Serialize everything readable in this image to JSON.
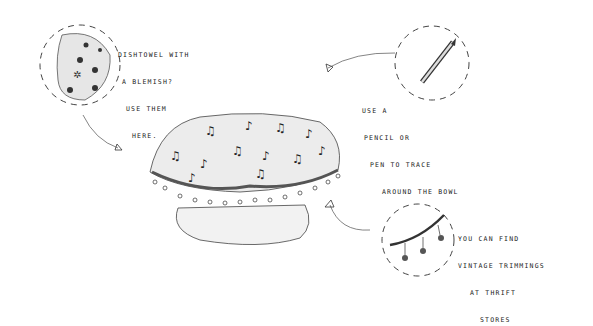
{
  "illustration": {
    "subject": "fabric-covered bowl with music-note print and pom-pom trim",
    "colors": {
      "ink": "#222222",
      "fabric_shade": "#cfcfcf",
      "background": "#ffffff"
    }
  },
  "callouts": [
    {
      "id": "dishtowel",
      "lines": [
        "DISHTOWEL WITH",
        "A BLEMISH?",
        "USE THEM",
        "HERE."
      ]
    },
    {
      "id": "pencil",
      "lines": [
        "USE A",
        "PENCIL OR",
        "PEN TO TRACE",
        "AROUND THE BOWL"
      ]
    },
    {
      "id": "trimmings",
      "lines": [
        "YOU CAN FIND",
        "VINTAGE TRIMMINGS",
        "AT THRIFT",
        "STORES"
      ]
    }
  ]
}
